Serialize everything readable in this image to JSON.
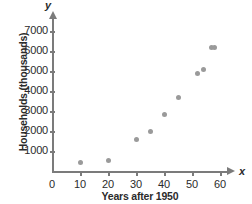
{
  "chart_data": {
    "type": "scatter",
    "title": "",
    "xlabel": "Years after 1950",
    "ylabel": "Households (thousands)",
    "x_axis_letter": "x",
    "y_axis_letter": "y",
    "xlim": [
      0,
      62
    ],
    "ylim": [
      0,
      7500
    ],
    "xticks": [
      0,
      10,
      20,
      30,
      40,
      50,
      60
    ],
    "xtick_labels": [
      "0",
      "10",
      "20",
      "30",
      "40",
      "50",
      "60"
    ],
    "yticks": [
      1000,
      2000,
      3000,
      4000,
      5000,
      6000,
      7000
    ],
    "ytick_labels": [
      "1000",
      "2000",
      "3000",
      "4000",
      "5000",
      "6000",
      "7000"
    ],
    "grid": false,
    "legend": null,
    "point_color": "#9a9a9a",
    "axis_color": "#7b7b7b",
    "points": [
      {
        "x": 10,
        "y": 450
      },
      {
        "x": 20,
        "y": 520
      },
      {
        "x": 30,
        "y": 1570
      },
      {
        "x": 35,
        "y": 1960
      },
      {
        "x": 40,
        "y": 2840
      },
      {
        "x": 45,
        "y": 3660
      },
      {
        "x": 52,
        "y": 4880
      },
      {
        "x": 54,
        "y": 5060
      },
      {
        "x": 57,
        "y": 6200
      },
      {
        "x": 58,
        "y": 6200
      }
    ]
  }
}
